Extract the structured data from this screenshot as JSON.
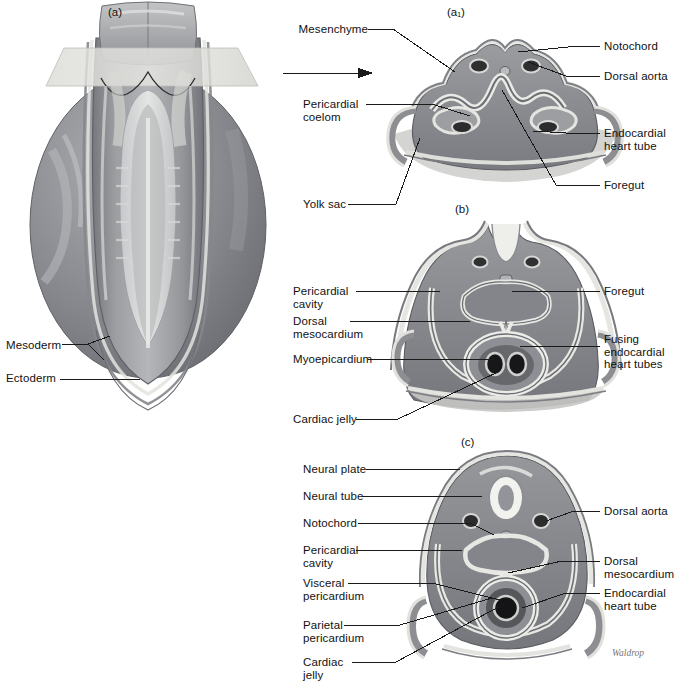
{
  "figure": {
    "title_panels": {
      "a": "(a)",
      "a1": "(a₁)",
      "b": "(b)",
      "c": "(c)"
    },
    "signature": "Waldrop",
    "colors": {
      "mesoderm_fill": "#8f9196",
      "mesoderm_dark": "#6e7076",
      "ectoderm_light": "#d8d8d4",
      "endoderm_light": "#e9e8e3",
      "lumen_dark": "#3a3a3c",
      "outline": "#4a4a4c",
      "leader": "#1a1a1a",
      "background": "#ffffff",
      "plane_plate": "#dcdcd8"
    }
  },
  "panel_a": {
    "tag": "(a)",
    "labels": [
      {
        "id": "mesoderm",
        "text": "Mesoderm",
        "x": 6,
        "y": 346,
        "align": "left"
      },
      {
        "id": "ectoderm",
        "text": "Ectoderm",
        "x": 6,
        "y": 380,
        "align": "left"
      }
    ]
  },
  "panel_a1": {
    "tag": "(a₁)",
    "labels_left": [
      {
        "id": "mesenchyme",
        "text": "Mesenchyme",
        "x": 303,
        "y": 24
      },
      {
        "id": "pericardial-coelom",
        "text": "Pericardial\ncoelom",
        "x": 303,
        "y": 99
      },
      {
        "id": "yolk-sac",
        "text": "Yolk sac",
        "x": 303,
        "y": 199
      }
    ],
    "labels_right": [
      {
        "id": "notochord",
        "text": "Notochord",
        "x": 604,
        "y": 41
      },
      {
        "id": "dorsal-aorta",
        "text": "Dorsal aorta",
        "x": 604,
        "y": 71
      },
      {
        "id": "endocardial-heart-tube",
        "text": "Endocardial\nheart tube",
        "x": 604,
        "y": 128
      },
      {
        "id": "foregut",
        "text": "Foregut",
        "x": 604,
        "y": 180
      }
    ]
  },
  "panel_b": {
    "tag": "(b)",
    "labels_left": [
      {
        "id": "pericardial-cavity",
        "text": "Pericardial\ncavity",
        "x": 293,
        "y": 286
      },
      {
        "id": "dorsal-mesocardium",
        "text": "Dorsal\nmesocardium",
        "x": 293,
        "y": 316
      },
      {
        "id": "myoepicardium",
        "text": "Myoepicardium",
        "x": 293,
        "y": 354
      },
      {
        "id": "cardiac-jelly",
        "text": "Cardiac jelly",
        "x": 293,
        "y": 414
      }
    ],
    "labels_right": [
      {
        "id": "foregut-b",
        "text": "Foregut",
        "x": 604,
        "y": 286
      },
      {
        "id": "fusing-endocardial-heart-tubes",
        "text": "Fusing\nendocardial\nheart tubes",
        "x": 604,
        "y": 341
      }
    ]
  },
  "panel_c": {
    "tag": "(c)",
    "labels_left": [
      {
        "id": "neural-plate",
        "text": "Neural plate",
        "x": 303,
        "y": 464
      },
      {
        "id": "neural-tube",
        "text": "Neural tube",
        "x": 303,
        "y": 491
      },
      {
        "id": "notochord-c",
        "text": "Notochord",
        "x": 303,
        "y": 518
      },
      {
        "id": "pericardial-cavity-c",
        "text": "Pericardial\ncavity",
        "x": 303,
        "y": 545
      },
      {
        "id": "visceral-pericardium",
        "text": "Visceral\npericardium",
        "x": 303,
        "y": 578
      },
      {
        "id": "parietal-pericardium",
        "text": "Parietal\npericardium",
        "x": 303,
        "y": 620
      },
      {
        "id": "cardiac-jelly-c",
        "text": "Cardiac\njelly",
        "x": 303,
        "y": 657
      }
    ],
    "labels_right": [
      {
        "id": "dorsal-aorta-c",
        "text": "Dorsal aorta",
        "x": 604,
        "y": 506
      },
      {
        "id": "dorsal-mesocardium-c",
        "text": "Dorsal\nmesocardium",
        "x": 604,
        "y": 556
      },
      {
        "id": "endocardial-heart-tube-c",
        "text": "Endocardial\nheart tube",
        "x": 604,
        "y": 588
      }
    ]
  }
}
